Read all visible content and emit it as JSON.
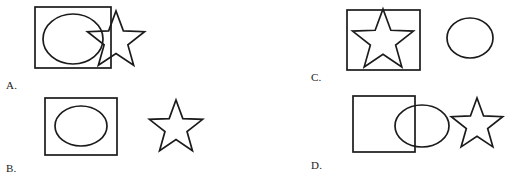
{
  "page": {
    "kind": "multiple-choice-shape-figure",
    "width": 507,
    "height": 172,
    "background_color": "#ffffff",
    "stroke_color": "#1b1b1b",
    "fill_color": "#ffffff"
  },
  "options": [
    {
      "id": "A",
      "label": "A.",
      "label_x": 6,
      "label_y": 80,
      "description": "Rectangle containing an ellipse, with a star overlapping and extending beyond the rectangle's right edge",
      "shapes": [
        {
          "name": "rectangle",
          "type": "rect",
          "x": 35,
          "y": 7,
          "w": 76,
          "h": 61
        },
        {
          "name": "ellipse",
          "type": "ellipse",
          "cx": 73,
          "cy": 39,
          "rx": 30,
          "ry": 25
        },
        {
          "name": "star",
          "type": "star",
          "cx": 116,
          "cy": 41,
          "r_outer": 30,
          "r_inner": 12.5,
          "rotation": 0
        }
      ]
    },
    {
      "id": "B",
      "label": "B.",
      "label_x": 6,
      "label_y": 163,
      "description": "Rectangle containing an ellipse, and a separate star placed to the right",
      "shapes": [
        {
          "name": "rectangle",
          "type": "rect",
          "x": 45,
          "y": 98,
          "w": 72,
          "h": 57
        },
        {
          "name": "ellipse",
          "type": "ellipse",
          "cx": 81,
          "cy": 126,
          "rx": 26,
          "ry": 20
        },
        {
          "name": "star",
          "type": "star",
          "cx": 176,
          "cy": 128,
          "r_outer": 28,
          "r_inner": 11.6,
          "rotation": 0
        }
      ]
    },
    {
      "id": "C",
      "label": "C.",
      "label_x": 311,
      "label_y": 72,
      "description": "Rectangle containing a star that spans its full width, and a separate ellipse to the right",
      "shapes": [
        {
          "name": "rectangle",
          "type": "rect",
          "x": 347,
          "y": 10,
          "w": 73,
          "h": 60
        },
        {
          "name": "star",
          "type": "star",
          "cx": 383,
          "cy": 41,
          "r_outer": 32,
          "r_inner": 13.3,
          "rotation": 0
        },
        {
          "name": "ellipse",
          "type": "ellipse",
          "cx": 470,
          "cy": 38,
          "rx": 23,
          "ry": 20
        }
      ]
    },
    {
      "id": "D",
      "label": "D.",
      "label_x": 311,
      "label_y": 160,
      "description": "Square overlapping an ellipse on its right side, and a separate star to the right",
      "shapes": [
        {
          "name": "rectangle",
          "type": "rect",
          "x": 353,
          "y": 96,
          "w": 62,
          "h": 56
        },
        {
          "name": "ellipse",
          "type": "ellipse",
          "cx": 422,
          "cy": 126,
          "rx": 27,
          "ry": 21
        },
        {
          "name": "star",
          "type": "star",
          "cx": 477,
          "cy": 125,
          "r_outer": 27,
          "r_inner": 11.2,
          "rotation": 0
        }
      ]
    }
  ]
}
